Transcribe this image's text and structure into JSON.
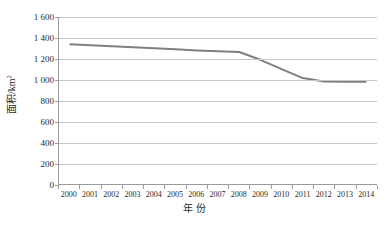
{
  "chart_data": {
    "type": "line",
    "title": "",
    "xlabel": "年 份",
    "ylabel": "面积/km",
    "ylabel_sup": "2",
    "ylabel_full": "面积/km²",
    "categories": [
      2000,
      2001,
      2002,
      2003,
      2004,
      2005,
      2006,
      2007,
      2008,
      2009,
      2010,
      2011,
      2012,
      2013,
      2014
    ],
    "x_tick_labels": [
      "2000",
      "2001",
      "2002",
      "2003",
      "2004",
      "2005",
      "2006",
      "2007",
      "2008",
      "2009",
      "2010",
      "2011",
      "2012",
      "2013",
      "2014"
    ],
    "series": [
      {
        "name": "面积",
        "color": "#7f7f7f",
        "values": [
          1340,
          1330,
          1320,
          1310,
          1300,
          1290,
          1280,
          1272,
          1265,
          1190,
          1100,
          1015,
          982,
          980,
          980
        ]
      }
    ],
    "values": [
      1340,
      1330,
      1320,
      1310,
      1300,
      1290,
      1280,
      1272,
      1265,
      1190,
      1100,
      1015,
      982,
      980,
      980
    ],
    "ylim": [
      0,
      1600
    ],
    "y_tick_values": [
      0,
      200,
      400,
      600,
      800,
      1000,
      1200,
      1400,
      1600
    ],
    "y_tick_labels": [
      "0",
      "200",
      "400",
      "600",
      "800",
      "1 000",
      "1 200",
      "1 400",
      "1 600"
    ],
    "grid": true,
    "grid_axis": "y",
    "legend": false,
    "legend_position": "none",
    "line_width": 2,
    "markers": false
  },
  "style": {
    "line_color": "#7f7f7f",
    "grid_color": "#c8c8c8",
    "axis_color": "#9a9a9a",
    "text_color": "#2b2b2b",
    "background": "#ffffff"
  }
}
